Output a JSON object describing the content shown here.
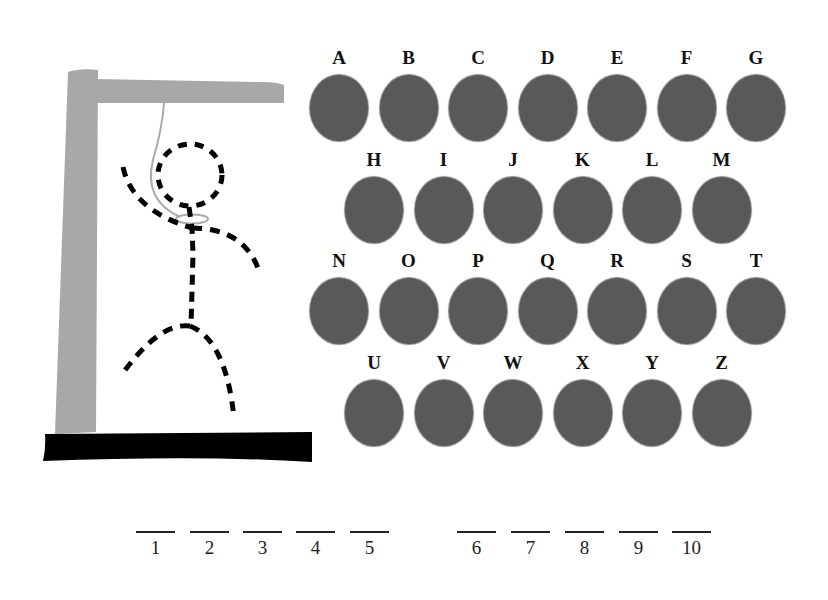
{
  "game": "hangman",
  "colors": {
    "post": "#a8a8a8",
    "base": "#000000",
    "key_fill": "#595959",
    "figure": "#000000",
    "rope": "#aaaaaa"
  },
  "gallows": {
    "figure_parts": [
      "head",
      "body",
      "left-arm",
      "right-arm",
      "left-leg",
      "right-leg"
    ],
    "figure_style": "dashed"
  },
  "keyboard": {
    "rows": [
      [
        "A",
        "B",
        "C",
        "D",
        "E",
        "F",
        "G"
      ],
      [
        "H",
        "I",
        "J",
        "K",
        "L",
        "M"
      ],
      [
        "N",
        "O",
        "P",
        "Q",
        "R",
        "S",
        "T"
      ],
      [
        "U",
        "V",
        "W",
        "X",
        "Y",
        "Z"
      ]
    ]
  },
  "word": {
    "groups": [
      [
        {
          "num": "1",
          "letter": ""
        },
        {
          "num": "2",
          "letter": ""
        },
        {
          "num": "3",
          "letter": ""
        },
        {
          "num": "4",
          "letter": ""
        },
        {
          "num": "5",
          "letter": ""
        }
      ],
      [
        {
          "num": "6",
          "letter": ""
        },
        {
          "num": "7",
          "letter": ""
        },
        {
          "num": "8",
          "letter": ""
        },
        {
          "num": "9",
          "letter": ""
        },
        {
          "num": "10",
          "letter": ""
        }
      ]
    ]
  }
}
